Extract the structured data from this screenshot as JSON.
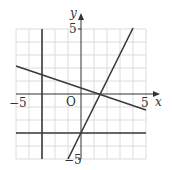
{
  "diagram": {
    "type": "coordinate-grid-graph",
    "axes": {
      "x_label": "x",
      "y_label": "y",
      "origin_label": "O",
      "x_range": [
        -5,
        5
      ],
      "y_range": [
        -5,
        5
      ],
      "tick_labels": {
        "x_min": "−5",
        "x_max": "5",
        "y_max": "5",
        "y_min": "−5"
      }
    },
    "grid": {
      "step": 1,
      "color": "#d9d9d9"
    },
    "lines": [
      {
        "name": "steep-line",
        "equation": "y = 2x - 3",
        "from": [
          -1,
          -5
        ],
        "to": [
          4,
          5
        ]
      },
      {
        "name": "shallow-line",
        "equation": "y = -(x - 1.5)/3",
        "from": [
          -5,
          2.17
        ],
        "to": [
          5,
          -1.17
        ]
      },
      {
        "name": "horizontal-line",
        "equation": "y = -3",
        "from": [
          -5,
          -3
        ],
        "to": [
          5,
          -3
        ]
      },
      {
        "name": "vertical-line",
        "equation": "x = -3",
        "from": [
          -3,
          -5
        ],
        "to": [
          -3,
          5
        ]
      }
    ],
    "line_color": "#3a3a3a"
  }
}
